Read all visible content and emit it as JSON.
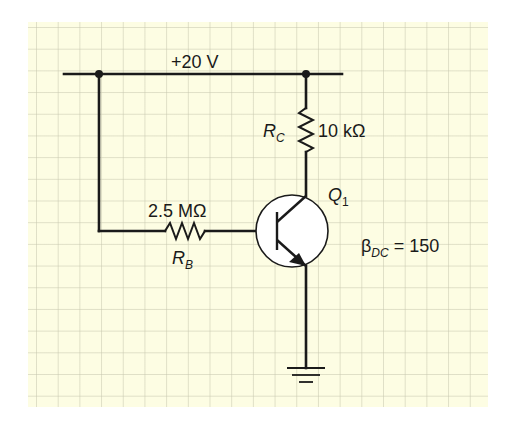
{
  "diagram": {
    "type": "transistor-base-bias-circuit",
    "supply": {
      "label": "+20 V"
    },
    "collector_resistor": {
      "name": "R",
      "subscript": "C",
      "value": "10 kΩ"
    },
    "base_resistor": {
      "name": "R",
      "subscript": "B",
      "value": "2.5 MΩ"
    },
    "transistor": {
      "name": "Q",
      "subscript": "1",
      "type": "NPN"
    },
    "beta": {
      "symbol": "β",
      "subscript": "DC",
      "value": "= 150"
    },
    "ground": {
      "label": "ground"
    }
  },
  "colors": {
    "paper": "#fdfde3",
    "grid": "#cfcfb4",
    "wire": "#1a1a1a"
  }
}
